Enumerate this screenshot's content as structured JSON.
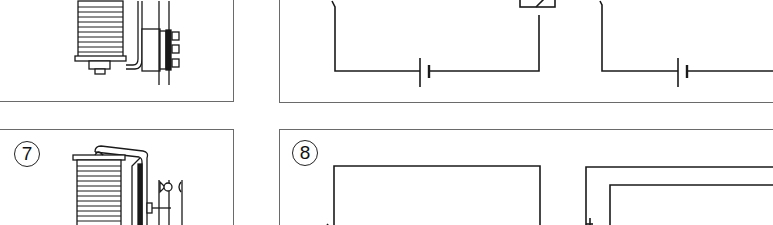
{
  "figure": {
    "panels": [
      {
        "id": "relay-top",
        "description": "relay illustration (coil, armature, contacts)"
      },
      {
        "id": "circuit-top",
        "description": "circuit schematic with battery and relay"
      },
      {
        "id": "relay-7",
        "label": "7",
        "description": "relay illustration with contacts"
      },
      {
        "id": "circuit-8",
        "label": "8",
        "description": "circuit schematic"
      }
    ],
    "labels": {
      "panel7": "7",
      "panel8": "8"
    },
    "colors": {
      "line": "#1a1a1a",
      "border": "#6a6a6a",
      "background": "#ffffff"
    }
  }
}
